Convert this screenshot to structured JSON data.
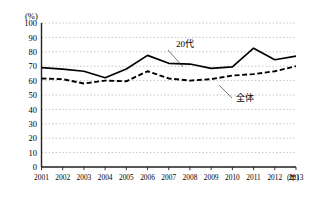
{
  "chart_data": {
    "type": "line",
    "title": "",
    "xlabel": "年",
    "ylabel": "(%)",
    "y_unit": "(%)",
    "x_unit": "(年)",
    "grid": true,
    "grid_style": "dotted-horizontal",
    "legend": "inline-labels",
    "xlim": [
      2001,
      2013
    ],
    "ylim": [
      0,
      100
    ],
    "ytick_step": 10,
    "categories": [
      "2001",
      "2002",
      "2003",
      "2004",
      "2005",
      "2006",
      "2007",
      "2008",
      "2009",
      "2010",
      "2011",
      "2012",
      "2013"
    ],
    "yticks": [
      "0",
      "10",
      "20",
      "30",
      "40",
      "50",
      "60",
      "70",
      "80",
      "90",
      "100"
    ],
    "series": [
      {
        "name": "20代",
        "style": "solid",
        "color": "#000000",
        "label_x": "2007",
        "values": [
          69,
          68,
          66.5,
          62,
          68,
          77.5,
          72,
          71.5,
          68.5,
          69.5,
          82.5,
          74.5,
          77
        ]
      },
      {
        "name": "全体",
        "style": "dashed",
        "color": "#000000",
        "label_x": "2011",
        "values": [
          61.5,
          61,
          58,
          60,
          59.5,
          66.5,
          61.5,
          60,
          61,
          63.5,
          64.5,
          66.5,
          70
        ]
      }
    ]
  },
  "axes": {
    "y_unit_label": "(%)",
    "x_unit_label": "(年)"
  }
}
